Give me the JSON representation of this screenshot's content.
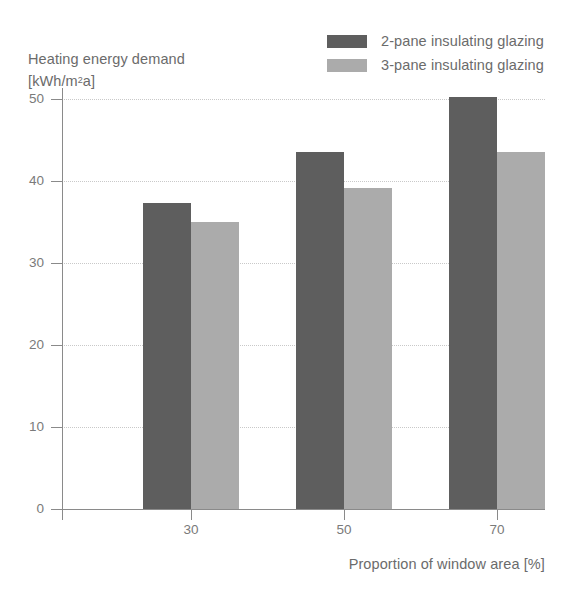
{
  "chart_data": {
    "type": "bar",
    "title": "",
    "subtitle": "",
    "xlabel": "Proportion of window area [%]",
    "ylabel": "Heating energy demand [kWh/m²a]",
    "ylabel_line1": "Heating energy demand",
    "ylabel_line2_prefix": "[kWh/m",
    "ylabel_line2_sup": "2",
    "ylabel_line2_suffix": "a]",
    "categories": [
      "30",
      "50",
      "70"
    ],
    "series": [
      {
        "name": "2-pane insulating glazing",
        "color": "#5e5e5e",
        "values": [
          37.3,
          43.5,
          50.2
        ]
      },
      {
        "name": "3-pane insulating glazing",
        "color": "#ababab",
        "values": [
          35.0,
          39.1,
          43.5
        ]
      }
    ],
    "ylim": [
      0,
      52
    ],
    "yticks": [
      0,
      10,
      20,
      30,
      40,
      50
    ],
    "ytick_labels": [
      "0",
      "10",
      "20",
      "30",
      "40",
      "50"
    ],
    "grid": true,
    "grid_axis": "y",
    "legend_position": "top-right",
    "axis_color": "#8a8a8a",
    "grid_color": "#c9c9c9",
    "text_color": "#6b6b6b",
    "background": "#ffffff"
  },
  "legend": {
    "items": [
      {
        "label": "2-pane insulating glazing",
        "color": "#5e5e5e"
      },
      {
        "label": "3-pane insulating glazing",
        "color": "#ababab"
      }
    ]
  }
}
